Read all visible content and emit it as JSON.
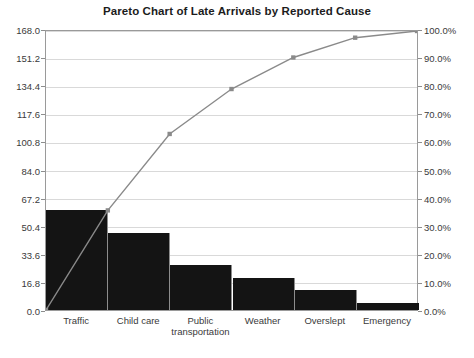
{
  "chart_data": {
    "type": "bar",
    "title": "Pareto Chart of Late Arrivals by Reported Cause",
    "xlabel": "",
    "ylabel": "",
    "categories": [
      "Traffic",
      "Child care",
      "Public transportation",
      "Weather",
      "Overslept",
      "Emergency"
    ],
    "values": [
      60,
      46,
      27,
      19,
      12,
      4
    ],
    "ylim": [
      0,
      168
    ],
    "y_ticks": [
      "0.0",
      "16.8",
      "33.6",
      "50.4",
      "67.2",
      "84.0",
      "100.8",
      "117.6",
      "134.4",
      "151.2",
      "168.0"
    ],
    "y2lim": [
      0,
      100
    ],
    "y2_ticks": [
      "0.0%",
      "10.0%",
      "20.0%",
      "30.0%",
      "40.0%",
      "50.0%",
      "60.0%",
      "70.0%",
      "80.0%",
      "90.0%",
      "100.0%"
    ],
    "series": [
      {
        "name": "Count",
        "kind": "bar",
        "values": [
          60,
          46,
          27,
          19,
          12,
          4
        ],
        "color": "#141414"
      },
      {
        "name": "Cumulative Percentage",
        "kind": "line",
        "values": [
          35.7,
          63.1,
          79.2,
          90.5,
          97.6,
          100.0
        ],
        "color": "#8a8a8a",
        "start_at_origin": true
      }
    ],
    "grid": true,
    "legend": "none",
    "bar_gap": 0
  },
  "colors": {
    "bar": "#141414",
    "line": "#8a8a8a",
    "grid": "#d9d9d9",
    "axis": "#9a9a9a",
    "background": "#ffffff",
    "text": "#3a3a3a",
    "title": "#1c1c1c"
  }
}
